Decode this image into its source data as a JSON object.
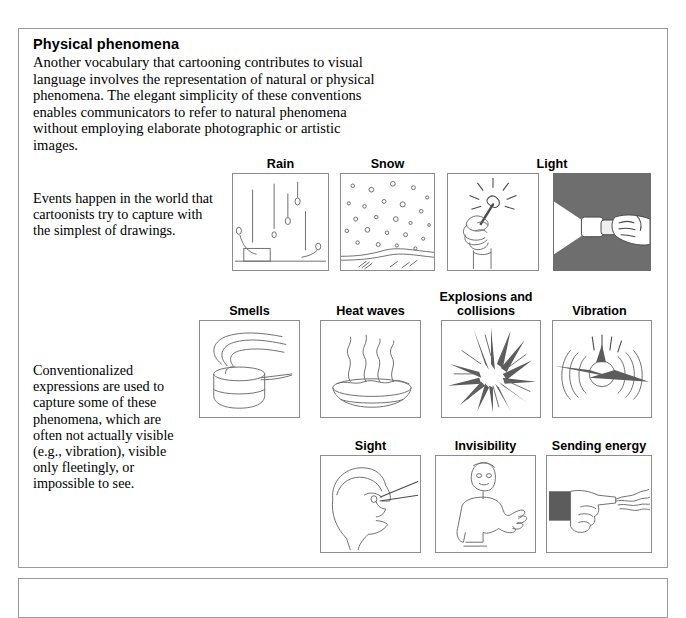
{
  "document": {
    "section_heading": "Physical phenomena",
    "intro_paragraph": "Another vocabulary that cartooning contributes to visual language involves the representation of natural or physical phenomena.  The elegant simplicity of these conventions enables communicators to refer to natural phenomena without employing elaborate photographic or artistic images.",
    "side_note_1": "Events happen in the world that cartoonists try to capture with the simplest of drawings.",
    "side_note_2": "Conventionalized expressions are used to capture some of these phenomena, which are often not actually visible (e.g., vibration), visible only fleetingly, or impossible to see."
  },
  "figure_rows": [
    {
      "row_id": "row-1",
      "captions": [
        {
          "label": "Rain",
          "x": 232,
          "width": 97
        },
        {
          "label": "Snow",
          "x": 340,
          "width": 95
        },
        {
          "label": "Light",
          "x": 447,
          "width": 210
        }
      ],
      "panels": [
        {
          "name": "rain-panel",
          "label": "Rain",
          "x": 232,
          "y": 173,
          "w": 97,
          "h": 98,
          "dark": false
        },
        {
          "name": "snow-panel",
          "label": "Snow",
          "x": 340,
          "y": 173,
          "w": 95,
          "h": 98,
          "dark": false
        },
        {
          "name": "match-panel",
          "label": "Light",
          "x": 447,
          "y": 173,
          "w": 92,
          "h": 98,
          "dark": false
        },
        {
          "name": "flashlight-panel",
          "label": "Light",
          "x": 553,
          "y": 173,
          "w": 98,
          "h": 98,
          "dark": true
        }
      ]
    },
    {
      "row_id": "row-2",
      "captions": [
        {
          "label": "Smells",
          "x": 199,
          "width": 101
        },
        {
          "label": "Heat waves",
          "x": 320,
          "width": 101
        },
        {
          "label": "Explosions and collisions",
          "x": 431,
          "width": 110
        },
        {
          "label": "Vibration",
          "x": 547,
          "width": 105
        }
      ],
      "panels": [
        {
          "name": "smells-panel",
          "label": "Smells",
          "x": 199,
          "y": 320,
          "w": 101,
          "h": 98,
          "dark": false
        },
        {
          "name": "heat-waves-panel",
          "label": "Heat waves",
          "x": 320,
          "y": 320,
          "w": 101,
          "h": 98,
          "dark": false
        },
        {
          "name": "explosions-panel",
          "label": "Explosions and collisions",
          "x": 441,
          "y": 320,
          "w": 100,
          "h": 98,
          "dark": false
        },
        {
          "name": "vibration-panel",
          "label": "Vibration",
          "x": 552,
          "y": 320,
          "w": 100,
          "h": 98,
          "dark": false
        }
      ]
    },
    {
      "row_id": "row-3",
      "captions": [
        {
          "label": "Sight",
          "x": 320,
          "width": 101
        },
        {
          "label": "Invisibility",
          "x": 435,
          "width": 101
        },
        {
          "label": "Sending energy",
          "x": 546,
          "width": 106
        }
      ],
      "panels": [
        {
          "name": "sight-panel",
          "label": "Sight",
          "x": 320,
          "y": 455,
          "w": 101,
          "h": 98,
          "dark": false
        },
        {
          "name": "invisibility-panel",
          "label": "Invisibility",
          "x": 435,
          "y": 455,
          "w": 101,
          "h": 98,
          "dark": false
        },
        {
          "name": "sending-energy-panel",
          "label": "Sending energy",
          "x": 546,
          "y": 455,
          "w": 106,
          "h": 98,
          "dark": false
        }
      ]
    }
  ],
  "colors": {
    "page_background": "#ffffff",
    "frame_border": "#9a9a9a",
    "panel_border": "#8d8d8d",
    "ink": "#6f6f6f",
    "dark_panel_fill": "#6e6e6e",
    "text": "#000000"
  }
}
